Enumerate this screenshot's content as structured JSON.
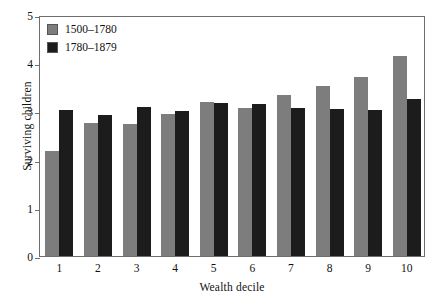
{
  "chart_data": {
    "type": "bar",
    "title": "",
    "xlabel": "Wealth decile",
    "ylabel": "Surviving children",
    "categories": [
      "1",
      "2",
      "3",
      "4",
      "5",
      "6",
      "7",
      "8",
      "9",
      "10"
    ],
    "series": [
      {
        "name": "1500–1780",
        "color": "#7d7d7d",
        "values": [
          2.18,
          2.76,
          2.73,
          2.95,
          3.19,
          3.07,
          3.34,
          3.52,
          3.72,
          4.14
        ]
      },
      {
        "name": "1780–1879",
        "color": "#1c1c1c",
        "values": [
          3.02,
          2.92,
          3.1,
          3.0,
          3.18,
          3.15,
          3.07,
          3.04,
          3.02,
          3.26
        ]
      }
    ],
    "ylim": [
      0,
      5
    ],
    "yticks": [
      "0",
      "1",
      "2",
      "3",
      "4",
      "5"
    ],
    "ytick_values": [
      0,
      1,
      2,
      3,
      4,
      5
    ],
    "grid": false,
    "legend_position": "top-left"
  },
  "legend": {
    "entries": [
      {
        "label": "1500–1780"
      },
      {
        "label": "1780–1879"
      }
    ]
  }
}
